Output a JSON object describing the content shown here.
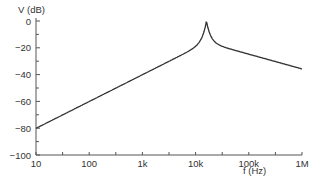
{
  "chart_data": {
    "type": "line",
    "title": "",
    "xlabel": "f (Hz)",
    "ylabel": "V (dB)",
    "xscale": "log",
    "xlim": [
      10,
      1000000
    ],
    "ylim": [
      -100,
      0
    ],
    "x_ticks": [
      10,
      100,
      1000,
      10000,
      100000,
      1000000
    ],
    "x_tick_labels": [
      "10",
      "100",
      "1k",
      "10k",
      "100k",
      "1M"
    ],
    "y_ticks": [
      0,
      -20,
      -40,
      -60,
      -80,
      -100
    ],
    "y_tick_labels": [
      "0",
      "−20",
      "−40",
      "−60",
      "−80",
      "−100"
    ],
    "grid": false,
    "legend": null,
    "series": [
      {
        "name": "V",
        "color": "#333333",
        "x": [
          10,
          100,
          1000,
          5000,
          10000,
          13000,
          15000,
          16000,
          17000,
          20000,
          30000,
          50000,
          100000,
          1000000
        ],
        "values": [
          -100,
          -80,
          -60,
          -46,
          -38,
          -30,
          -20,
          0,
          -20,
          -30,
          -42,
          -50,
          -56,
          -75
        ]
      }
    ],
    "resonance_frequency_hz": 16000
  }
}
